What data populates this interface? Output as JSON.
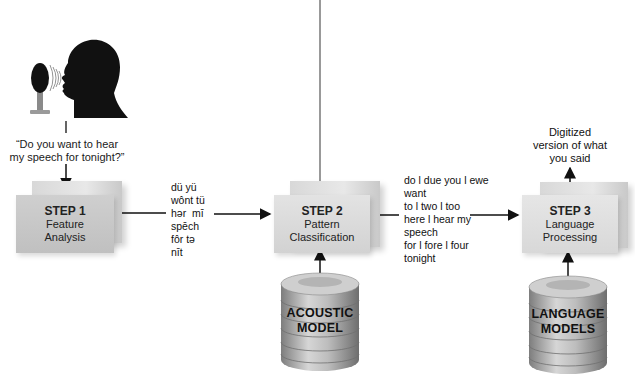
{
  "diagram": {
    "speaker": {
      "icon": "speaker-silhouette-with-microphone"
    },
    "quote": [
      "“Do you want to hear",
      "my speech for tonight?”"
    ],
    "steps": [
      {
        "title": "STEP 1",
        "lines": [
          "Feature",
          "Analysis"
        ]
      },
      {
        "title": "STEP 2",
        "lines": [
          "Pattern",
          "Classification"
        ]
      },
      {
        "title": "STEP 3",
        "lines": [
          "Language",
          "Processing"
        ]
      }
    ],
    "phonetic": [
      "dü yü",
      "wônt tü",
      "hər  mī",
      "spēch",
      "fôr tə",
      "nīt"
    ],
    "candidates": [
      "do l due you l ewe",
      "want",
      "to l two l too",
      "here l hear my",
      "speech",
      "for l fore l four",
      "tonight"
    ],
    "output": [
      "Digitized",
      "version of what",
      "you said"
    ],
    "databases": [
      {
        "lines": [
          "ACOUSTIC",
          "MODEL"
        ]
      },
      {
        "lines": [
          "LANGUAGE",
          "MODELS"
        ]
      }
    ]
  },
  "colors": {
    "box": "#d4d4d4",
    "box_dark": "#c2c2c2",
    "cylinder": "#a9a9a9",
    "line": "#111111"
  }
}
